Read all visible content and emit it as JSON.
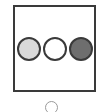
{
  "option_card": {
    "swatches": [
      {
        "name": "light-gray",
        "color": "#d9d9d9"
      },
      {
        "name": "white",
        "color": "#ffffff"
      },
      {
        "name": "dark-gray",
        "color": "#6e6e6e"
      }
    ]
  },
  "radio": {
    "selected": false
  }
}
